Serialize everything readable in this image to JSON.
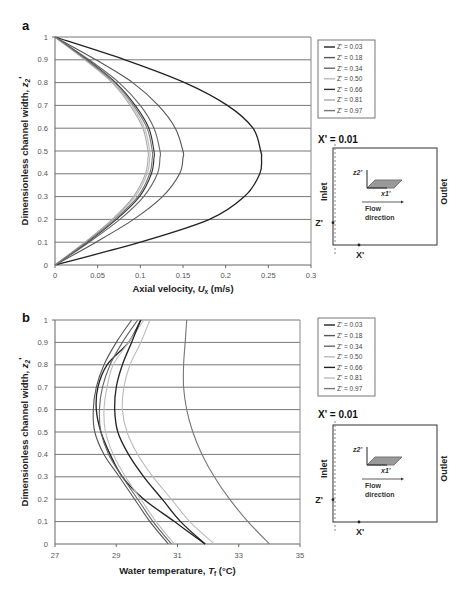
{
  "chart_data": [
    {
      "panel": "a",
      "type": "line",
      "xlabel": "Axial velocity, U_x (m/s)",
      "ylabel": "Dimensionless channel width, z2'",
      "xlim": [
        0,
        0.3
      ],
      "ylim": [
        0,
        1
      ],
      "x_ticks": [
        "0",
        "0.05",
        "0.1",
        "0.15",
        "0.2",
        "0.25",
        "0.3"
      ],
      "y_ticks": [
        "0",
        "0.1",
        "0.2",
        "0.3",
        "0.4",
        "0.5",
        "0.6",
        "0.7",
        "0.8",
        "0.9",
        "1"
      ],
      "grid": "horizontal",
      "legend_position": "right",
      "y": [
        0,
        0.1,
        0.2,
        0.3,
        0.4,
        0.47,
        0.5,
        0.6,
        0.7,
        0.8,
        0.9,
        1.0
      ],
      "series": [
        {
          "name": "Z' = 0.03",
          "color": "#222222",
          "values": [
            0,
            0.1,
            0.181,
            0.222,
            0.24,
            0.242,
            0.241,
            0.232,
            0.202,
            0.152,
            0.082,
            0
          ]
        },
        {
          "name": "Z' = 0.18",
          "color": "#555555",
          "values": [
            0,
            0.048,
            0.092,
            0.126,
            0.146,
            0.15,
            0.15,
            0.141,
            0.121,
            0.091,
            0.048,
            0
          ]
        },
        {
          "name": "Z' = 0.34",
          "color": "#666666",
          "values": [
            0,
            0.04,
            0.076,
            0.104,
            0.12,
            0.123,
            0.123,
            0.116,
            0.1,
            0.075,
            0.04,
            0
          ]
        },
        {
          "name": "Z' = 0.50",
          "color": "#bbbbbb",
          "values": [
            0,
            0.036,
            0.068,
            0.094,
            0.108,
            0.111,
            0.111,
            0.105,
            0.09,
            0.068,
            0.036,
            0
          ]
        },
        {
          "name": "Z' = 0.66",
          "color": "#333333",
          "values": [
            0,
            0.038,
            0.072,
            0.099,
            0.113,
            0.116,
            0.116,
            0.11,
            0.094,
            0.071,
            0.038,
            0
          ]
        },
        {
          "name": "Z' = 0.81",
          "color": "#aaaaaa",
          "values": [
            0,
            0.035,
            0.067,
            0.092,
            0.106,
            0.109,
            0.109,
            0.103,
            0.088,
            0.067,
            0.035,
            0
          ]
        },
        {
          "name": "Z' = 0.97",
          "color": "#777777",
          "values": [
            0,
            0.037,
            0.07,
            0.097,
            0.111,
            0.114,
            0.114,
            0.108,
            0.092,
            0.07,
            0.037,
            0
          ]
        }
      ]
    },
    {
      "panel": "b",
      "type": "line",
      "xlabel": "Water temperature, T_f (°C)",
      "ylabel": "Dimensionless channel width, z2'",
      "xlim": [
        27,
        35
      ],
      "ylim": [
        0,
        1
      ],
      "x_ticks": [
        "27",
        "29",
        "31",
        "33",
        "35"
      ],
      "y_ticks": [
        "0",
        "0.1",
        "0.2",
        "0.3",
        "0.4",
        "0.5",
        "0.6",
        "0.7",
        "0.8",
        "0.9",
        "1"
      ],
      "grid": "horizontal",
      "legend_position": "right",
      "y": [
        0,
        0.1,
        0.2,
        0.3,
        0.4,
        0.5,
        0.6,
        0.7,
        0.8,
        0.9,
        1.0
      ],
      "series": [
        {
          "name": "Z' = 0.03",
          "color": "#222222",
          "values": [
            31.9,
            30.9,
            29.9,
            29.2,
            28.8,
            28.5,
            28.35,
            28.4,
            28.7,
            29.4,
            29.8
          ]
        },
        {
          "name": "Z' = 0.18",
          "color": "#555555",
          "values": [
            30.7,
            30.1,
            29.6,
            29.1,
            28.6,
            28.3,
            28.25,
            28.35,
            28.6,
            29.0,
            29.5
          ]
        },
        {
          "name": "Z' = 0.34",
          "color": "#666666",
          "values": [
            30.8,
            30.2,
            29.7,
            29.2,
            28.75,
            28.5,
            28.45,
            28.55,
            28.8,
            29.2,
            29.7
          ]
        },
        {
          "name": "Z' = 0.50",
          "color": "#bbbbbb",
          "values": [
            30.9,
            30.3,
            29.8,
            29.3,
            28.9,
            28.65,
            28.6,
            28.7,
            28.9,
            29.4,
            29.9
          ]
        },
        {
          "name": "Z' = 0.66",
          "color": "#222222",
          "values": [
            31.9,
            31.1,
            30.5,
            29.9,
            29.4,
            29.05,
            28.95,
            29.0,
            29.2,
            29.5,
            29.8
          ]
        },
        {
          "name": "Z' = 0.81",
          "color": "#bbbbbb",
          "values": [
            32.2,
            31.4,
            30.8,
            30.2,
            29.7,
            29.35,
            29.2,
            29.25,
            29.45,
            29.8,
            30.1
          ]
        },
        {
          "name": "Z' = 0.97",
          "color": "#777777",
          "values": [
            34.0,
            33.3,
            32.7,
            32.2,
            31.8,
            31.5,
            31.3,
            31.2,
            31.2,
            31.25,
            31.3
          ]
        }
      ]
    }
  ],
  "panels": {
    "a": {
      "label": "a",
      "xlabel_main": "Axial velocity, ",
      "xlabel_var": "U",
      "xlabel_sub": "x",
      "xlabel_unit": " (m/s)"
    },
    "b": {
      "label": "b",
      "xlabel_main": "Water temperature, ",
      "xlabel_var": "T",
      "xlabel_sub": "f",
      "xlabel_unit": " (°C)"
    }
  },
  "ylabel_text": "Dimensionless channel width, ",
  "ylabel_var": "z",
  "ylabel_sub": "2",
  "ylabel_prime": "'",
  "position_label": "X' = 0.01",
  "inset": {
    "inlet": "Inlet",
    "outlet": "Outlet",
    "z_marker": "Z'",
    "x_marker": "X'",
    "axis_z": "z2'",
    "axis_x": "x1'",
    "flow_line1": "Flow",
    "flow_line2": "direction"
  }
}
